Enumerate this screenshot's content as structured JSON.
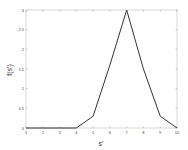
{
  "chart_data": {
    "type": "line",
    "title": "",
    "xlabel": "s'",
    "ylabel": "f(s')",
    "x": [
      1,
      2,
      3,
      4,
      5,
      6,
      7,
      8,
      9,
      10
    ],
    "series": [
      {
        "name": "f(s')",
        "values": [
          0,
          0,
          0,
          0,
          0.3,
          1.6,
          3,
          1.5,
          0.3,
          0
        ]
      }
    ],
    "xlim": [
      1,
      10
    ],
    "ylim": [
      0,
      3
    ],
    "xticks": [
      1,
      2,
      3,
      4,
      5,
      6,
      7,
      8,
      9,
      10
    ],
    "yticks": [
      0,
      0.5,
      1,
      1.5,
      2,
      2.5,
      3
    ],
    "ytick_labels": [
      "0",
      "0.5",
      "1",
      "1.5",
      "2",
      "2.5",
      "3"
    ],
    "grid": false,
    "legend": null,
    "line_color": "#333333"
  }
}
